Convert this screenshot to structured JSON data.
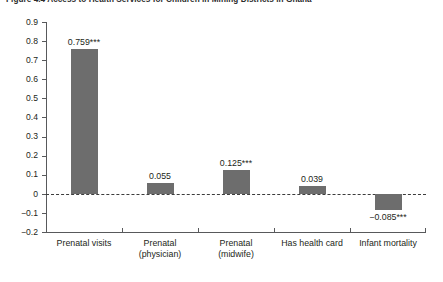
{
  "figure": {
    "title": "Figure 4.4  Access to Health Services for Children in Mining Districts in Ghana"
  },
  "chart_data": {
    "type": "bar",
    "title": "Figure 4.4  Access to Health Services for Children in Mining Districts in Ghana",
    "xlabel": "",
    "ylabel": "",
    "ylim": [
      -0.2,
      0.9
    ],
    "grid": false,
    "legend": null,
    "zero_line": true,
    "bar_color": "#6d6d6d",
    "categories": [
      "Prenatal visits",
      "Prenatal (physician)",
      "Prenatal (midwife)",
      "Has health card",
      "Infant mortality"
    ],
    "category_lines": [
      [
        "Prenatal visits"
      ],
      [
        "Prenatal",
        "(physician)"
      ],
      [
        "Prenatal",
        "(midwife)"
      ],
      [
        "Has health card"
      ],
      [
        "Infant mortality"
      ]
    ],
    "values": [
      0.759,
      0.055,
      0.125,
      0.039,
      -0.085
    ],
    "data_labels": [
      "0.759***",
      "0.055",
      "0.125***",
      "0.039",
      "−0.085***"
    ],
    "significance": [
      "***",
      "",
      "***",
      "",
      "***"
    ],
    "yticks": [
      0.9,
      0.8,
      0.7,
      0.6,
      0.5,
      0.4,
      0.3,
      0.2,
      0.1,
      0.0,
      -0.1,
      -0.2
    ],
    "ytick_labels": [
      "0.9",
      "0.8",
      "0.7",
      "0.6",
      "0.5",
      "0.4",
      "0.3",
      "0.2",
      "0.1",
      "0",
      "−0.1",
      "−0.2"
    ]
  }
}
